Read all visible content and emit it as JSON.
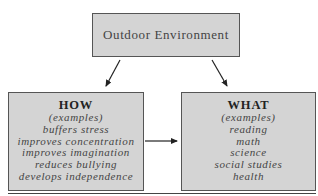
{
  "diagram": {
    "top_box": {
      "label": "Outdoor Environment"
    },
    "how_box": {
      "title": "HOW",
      "subtitle": "(examples)",
      "items": [
        "buffers stress",
        "improves concentration",
        "improves imagination",
        "reduces bullying",
        "develops independence"
      ]
    },
    "what_box": {
      "title": "WHAT",
      "subtitle": "(examples)",
      "items": [
        "reading",
        "math",
        "science",
        "social studies",
        "health"
      ]
    },
    "arrows": [
      {
        "from": "Outdoor Environment",
        "to": "HOW"
      },
      {
        "from": "Outdoor Environment",
        "to": "WHAT"
      },
      {
        "from": "HOW",
        "to": "WHAT"
      }
    ],
    "colors": {
      "box_fill": "#d4d4d4",
      "border": "#555555",
      "arrow": "#222222"
    }
  }
}
